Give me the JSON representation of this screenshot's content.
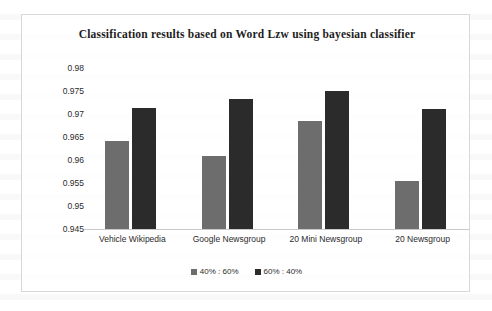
{
  "chart_data": {
    "type": "bar",
    "title": "Classification results based on Word Lzw using bayesian classifier",
    "xlabel": "",
    "ylabel": "",
    "ylim": [
      0.945,
      0.98
    ],
    "yticks": [
      "0.98",
      "0.975",
      "0.97",
      "0.965",
      "0.96",
      "0.955",
      "0.95",
      "0.945"
    ],
    "ytick_values": [
      0.98,
      0.975,
      0.97,
      0.965,
      0.96,
      0.955,
      0.95,
      0.945
    ],
    "grid": false,
    "legend_position": "bottom",
    "categories": [
      "Vehicle Wikipedia",
      "Google Newsgroup",
      "20 Mini Newsgroup",
      "20 Newsgroup"
    ],
    "series": [
      {
        "name": "40% : 60%",
        "color": "#6d6d6d",
        "values": [
          0.9641,
          0.9609,
          0.9685,
          0.9554
        ]
      },
      {
        "name": "60% : 40%",
        "color": "#2b2b2b",
        "values": [
          0.9713,
          0.9733,
          0.975,
          0.9711
        ]
      }
    ]
  },
  "frame": {
    "border_color": "#d8d8d8",
    "background": "#ffffff"
  }
}
